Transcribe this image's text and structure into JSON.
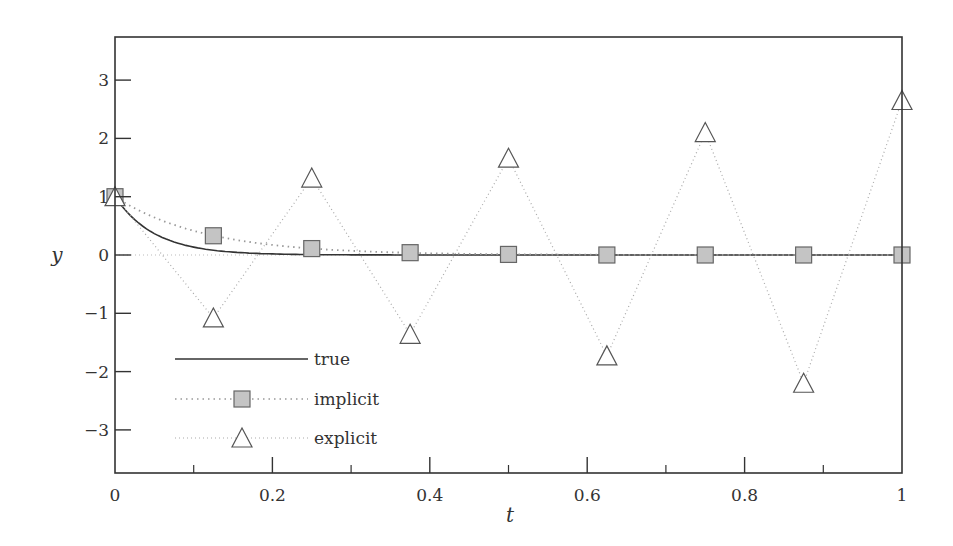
{
  "chart_data": {
    "type": "line",
    "title": "",
    "xlabel": "t",
    "ylabel": "y",
    "xlim": [
      0,
      1
    ],
    "ylim": [
      -3.7,
      3.8
    ],
    "xticks": [
      0,
      0.2,
      0.4,
      0.6,
      0.8,
      1
    ],
    "xtick_labels": [
      "0",
      "0.2",
      "0.4",
      "0.6",
      "0.8",
      "1"
    ],
    "xminor_ticks": [
      0.1,
      0.3,
      0.5,
      0.7,
      0.9
    ],
    "yticks": [
      3,
      2,
      1,
      0,
      -1,
      -2,
      -3
    ],
    "ytick_labels": [
      "3",
      "2",
      "1",
      "0",
      "−1",
      "−2",
      "−3"
    ],
    "grid": false,
    "legend_position": "lower left",
    "series": [
      {
        "name": "true",
        "style": "solid",
        "marker": "none",
        "x": [
          0,
          0.025,
          0.05,
          0.075,
          0.1,
          0.125,
          0.15,
          0.175,
          0.2,
          0.25,
          0.3,
          0.4,
          0.5,
          0.6,
          0.8,
          1.0
        ],
        "values": [
          1,
          0.61,
          0.37,
          0.22,
          0.14,
          0.08,
          0.05,
          0.03,
          0.02,
          0.01,
          0.0,
          0.0,
          0.0,
          0.0,
          0.0,
          0.0
        ]
      },
      {
        "name": "implicit",
        "style": "dotted",
        "marker": "square",
        "x": [
          0,
          0.125,
          0.25,
          0.375,
          0.5,
          0.625,
          0.75,
          0.875,
          1.0
        ],
        "values": [
          1,
          0.33,
          0.11,
          0.04,
          0.01,
          0.0,
          0.0,
          0.0,
          0.0
        ]
      },
      {
        "name": "explicit",
        "style": "dotted",
        "marker": "triangle",
        "x": [
          0,
          0.125,
          0.25,
          0.375,
          0.5,
          0.625,
          0.75,
          0.875,
          1.0
        ],
        "values": [
          1,
          -1.08,
          1.32,
          -1.36,
          1.66,
          -1.73,
          2.1,
          -2.2,
          2.65
        ]
      }
    ]
  },
  "legend": {
    "items": [
      {
        "label": "true"
      },
      {
        "label": "implicit"
      },
      {
        "label": "explicit"
      }
    ]
  },
  "colors": {
    "axis": "#333333",
    "true_line": "#333333",
    "implicit_line": "#999999",
    "explicit_line": "#aaaaaa",
    "square_fill": "#c4c4c4",
    "triangle_fill": "#ffffff"
  }
}
